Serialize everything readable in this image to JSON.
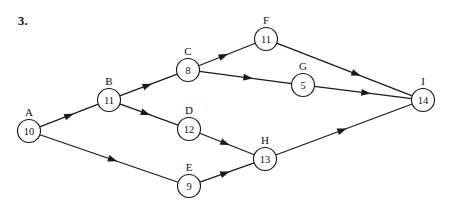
{
  "problem": {
    "number_label": "3."
  },
  "diagram": {
    "type": "directed-graph",
    "node_radius": 11.5,
    "nodes": [
      {
        "id": "A",
        "label": "A",
        "value": "10",
        "x": 29,
        "y": 131
      },
      {
        "id": "B",
        "label": "B",
        "value": "11",
        "x": 109,
        "y": 100
      },
      {
        "id": "C",
        "label": "C",
        "value": "8",
        "x": 188,
        "y": 70
      },
      {
        "id": "D",
        "label": "D",
        "value": "12",
        "x": 189,
        "y": 129
      },
      {
        "id": "E",
        "label": "E",
        "value": "9",
        "x": 189,
        "y": 186
      },
      {
        "id": "F",
        "label": "F",
        "value": "11",
        "x": 266,
        "y": 39
      },
      {
        "id": "G",
        "label": "G",
        "value": "5",
        "x": 303,
        "y": 85
      },
      {
        "id": "H",
        "label": "H",
        "value": "13",
        "x": 265,
        "y": 159
      },
      {
        "id": "I",
        "label": "I",
        "value": "14",
        "x": 423,
        "y": 100
      }
    ],
    "edges": [
      {
        "from": "A",
        "to": "B",
        "arrow_t": 0.58
      },
      {
        "from": "A",
        "to": "E",
        "arrow_t": 0.56
      },
      {
        "from": "B",
        "to": "C",
        "arrow_t": 0.56
      },
      {
        "from": "B",
        "to": "D",
        "arrow_t": 0.52
      },
      {
        "from": "C",
        "to": "F",
        "arrow_t": 0.52
      },
      {
        "from": "C",
        "to": "G",
        "arrow_t": 0.58
      },
      {
        "from": "D",
        "to": "H",
        "arrow_t": 0.55
      },
      {
        "from": "E",
        "to": "H",
        "arrow_t": 0.55
      },
      {
        "from": "F",
        "to": "I",
        "arrow_t": 0.62
      },
      {
        "from": "G",
        "to": "I",
        "arrow_t": 0.58
      },
      {
        "from": "H",
        "to": "I",
        "arrow_t": 0.52
      }
    ],
    "colors": {
      "stroke": "#1a1a1a",
      "node_fill": "#ffffff",
      "text": "#111111",
      "background": "#ffffff"
    }
  }
}
